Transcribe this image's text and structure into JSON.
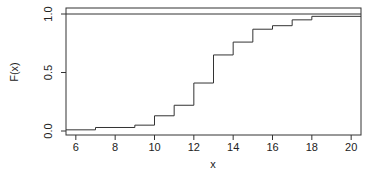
{
  "chart_data": {
    "type": "line",
    "subtype": "step",
    "title": "",
    "xlabel": "x",
    "ylabel": "F(x)",
    "xlim": [
      5.5,
      20.5
    ],
    "ylim": [
      0.0,
      1.0
    ],
    "xticks": [
      6,
      8,
      10,
      12,
      14,
      16,
      18,
      20
    ],
    "yticks": [
      0.0,
      0.5,
      1.0
    ],
    "ytick_labels": [
      "0.0",
      "0.5",
      "1.0"
    ],
    "xtick_labels": [
      "6",
      "8",
      "10",
      "12",
      "14",
      "16",
      "18",
      "20"
    ],
    "grid": false,
    "legend": null,
    "reference_lines": [
      {
        "y": 1.0
      }
    ],
    "series": [
      {
        "name": "F(x)",
        "x": [
          5.5,
          7,
          9,
          10,
          11,
          12,
          13,
          14,
          15,
          16,
          17,
          18,
          20.5
        ],
        "values": [
          0.01,
          0.03,
          0.05,
          0.13,
          0.22,
          0.41,
          0.65,
          0.76,
          0.87,
          0.9,
          0.95,
          0.98,
          0.98
        ]
      }
    ]
  }
}
